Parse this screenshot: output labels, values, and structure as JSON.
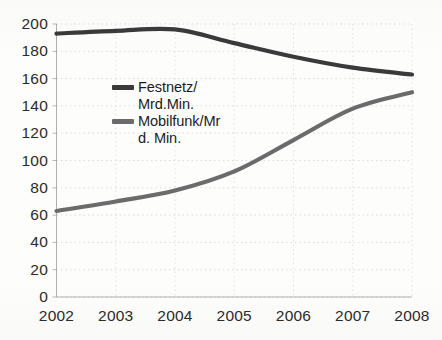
{
  "chart_data": {
    "type": "line",
    "title": "",
    "subtitle": "",
    "xlabel": "",
    "ylabel": "",
    "x": [
      2002,
      2003,
      2004,
      2005,
      2006,
      2007,
      2008
    ],
    "xtick_labels": [
      "2002",
      "2003",
      "2004",
      "2005",
      "2006",
      "2007",
      "2008"
    ],
    "ytick_labels": [
      "0",
      "20",
      "40",
      "60",
      "80",
      "100",
      "120",
      "140",
      "160",
      "180",
      "200"
    ],
    "ytick_values": [
      0,
      20,
      40,
      60,
      80,
      100,
      120,
      140,
      160,
      180,
      200
    ],
    "xlim": [
      2002,
      2008
    ],
    "ylim": [
      0,
      200
    ],
    "grid": true,
    "grid_style": "dotted",
    "legend_position": "inside-left-upper",
    "series": [
      {
        "name": "Festnetz/\nMrd.Min.",
        "legend_label": "Festnetz/\nMrd.Min.",
        "color": "#3a3a3a",
        "values": [
          193,
          195,
          196,
          186,
          176,
          168,
          163
        ]
      },
      {
        "name": "Mobilfunk/Mr\nd. Min.",
        "legend_label": "Mobilfunk/Mr\nd. Min.",
        "color": "#6b6b6b",
        "values": [
          63,
          70,
          78,
          92,
          115,
          138,
          150
        ]
      }
    ]
  },
  "colors": {
    "background": "#fdfdfc",
    "axis": "#9a9a9a",
    "grid": "#d6d6d6",
    "tick_label": "#2b2b2b",
    "series_festnetz": "#3a3a3a",
    "series_mobilfunk": "#6b6b6b"
  }
}
